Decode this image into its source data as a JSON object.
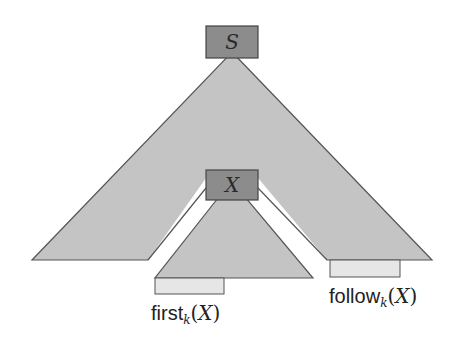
{
  "diagram": {
    "root_node": {
      "label": "S"
    },
    "inner_node": {
      "label": "X"
    },
    "first_set": {
      "name": "first",
      "subscript": "k",
      "open": "(",
      "var": "X",
      "close": ")"
    },
    "follow_set": {
      "name": "follow",
      "subscript": "k",
      "open": "(",
      "var": "X",
      "close": ")"
    },
    "colors": {
      "node_fill": "#8c8c8c",
      "tree_fill": "#c4c4c4",
      "set_box_fill": "#e6e6e6",
      "stroke": "#555555",
      "background": "#ffffff"
    }
  }
}
